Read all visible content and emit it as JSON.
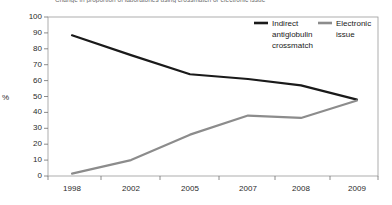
{
  "chart_data": {
    "type": "line",
    "title": "Change in proportion of laboratories using crossmatch or electronic issue",
    "xlabel": "",
    "ylabel": "%",
    "categories": [
      "1998",
      "2002",
      "2005",
      "2007",
      "2008",
      "2009"
    ],
    "x": [
      1998,
      2002,
      2005,
      2007,
      2008,
      2009
    ],
    "ylim": [
      0,
      100
    ],
    "yticks": [
      0,
      10,
      20,
      30,
      40,
      50,
      60,
      70,
      80,
      90,
      100
    ],
    "grid": false,
    "legend_position": "top-right",
    "series": [
      {
        "name": "Indirect antiglobulin crossmatch",
        "color": "#1a1a1a",
        "values": [
          88.5,
          76,
          64,
          61,
          57,
          48
        ]
      },
      {
        "name": "Electronic issue",
        "color": "#8c8c8c",
        "values": [
          1.5,
          10,
          26,
          38,
          36.5,
          47.5
        ]
      }
    ]
  },
  "legend": {
    "entries": [
      {
        "label_line1": "Indirect",
        "label_line2": "antiglobulin",
        "label_line3": "crossmatch"
      },
      {
        "label_line1": "Electronic",
        "label_line2": "issue",
        "label_line3": ""
      }
    ]
  },
  "axis": {
    "y_label": "%",
    "y_ticks": [
      "100",
      "90",
      "80",
      "70",
      "60",
      "50",
      "40",
      "30",
      "20",
      "10",
      "0"
    ],
    "x_ticks": [
      "1998",
      "2002",
      "2005",
      "2007",
      "2008",
      "2009"
    ]
  }
}
